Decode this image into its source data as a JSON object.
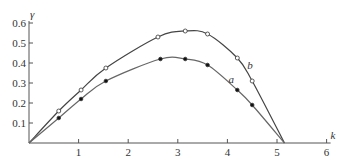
{
  "chart_data": {
    "type": "line",
    "title": "",
    "xlabel": "k",
    "ylabel": "γ",
    "xlim": [
      0,
      6
    ],
    "ylim": [
      0,
      0.6
    ],
    "x_ticks": [
      "1",
      "2",
      "3",
      "4",
      "5",
      "6"
    ],
    "y_ticks": [
      "0.1",
      "0.2",
      "0.3",
      "0.4",
      "0.5",
      "0.6"
    ],
    "grid": false,
    "legend": "inline curve labels",
    "series": [
      {
        "name": "b",
        "marker": "open-circle",
        "line_color": "#444444",
        "curve": [
          [
            0,
            0
          ],
          [
            0.6,
            0.16
          ],
          [
            1.05,
            0.265
          ],
          [
            1.55,
            0.375
          ],
          [
            2.6,
            0.53
          ],
          [
            3.15,
            0.56
          ],
          [
            3.6,
            0.545
          ],
          [
            4.2,
            0.425
          ],
          [
            4.5,
            0.31
          ],
          [
            5.15,
            0
          ]
        ],
        "points": [
          [
            0.6,
            0.16
          ],
          [
            1.05,
            0.265
          ],
          [
            1.55,
            0.375
          ],
          [
            2.6,
            0.53
          ],
          [
            3.15,
            0.56
          ],
          [
            3.6,
            0.545
          ],
          [
            4.2,
            0.425
          ],
          [
            4.5,
            0.31
          ]
        ],
        "label_pos": [
          4.4,
          0.37
        ]
      },
      {
        "name": "a",
        "marker": "filled-circle",
        "line_color": "#666666",
        "curve": [
          [
            0,
            0
          ],
          [
            0.6,
            0.125
          ],
          [
            1.05,
            0.22
          ],
          [
            1.55,
            0.31
          ],
          [
            2.65,
            0.42
          ],
          [
            3.15,
            0.42
          ],
          [
            3.6,
            0.39
          ],
          [
            4.2,
            0.265
          ],
          [
            4.5,
            0.19
          ],
          [
            5.15,
            0
          ]
        ],
        "points": [
          [
            0.6,
            0.125
          ],
          [
            1.05,
            0.22
          ],
          [
            1.55,
            0.31
          ],
          [
            2.65,
            0.42
          ],
          [
            3.15,
            0.42
          ],
          [
            3.6,
            0.39
          ],
          [
            4.2,
            0.265
          ],
          [
            4.5,
            0.19
          ]
        ],
        "label_pos": [
          4.02,
          0.3
        ]
      }
    ]
  },
  "axes": {
    "x_name": "k",
    "y_name": "γ"
  }
}
